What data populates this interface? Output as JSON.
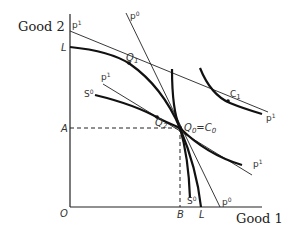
{
  "axes": {
    "y_title": "Good 2",
    "x_title": "Good 1",
    "origin": "O"
  },
  "labels": {
    "L_y": "L",
    "L_x": "L",
    "A": "A",
    "B": "B",
    "Q1": "Q",
    "Q1_sub": "1",
    "Q2": "Q",
    "Q2_sub": "2",
    "Q0": "Q",
    "Q0_sub": "0",
    "Q0_eq": "=C",
    "C0_sub": "0",
    "C1": "C",
    "C1_sub": "1",
    "p1_top": "p",
    "p1_top_sup": "1",
    "p0_top": "p",
    "p0_top_sup": "0",
    "p1_mid": "p",
    "p1_mid_sup": "1",
    "S0_left": "S",
    "S0_left_sup": "0",
    "p1_right_upper": "p",
    "p1_right_upper_sup": "1",
    "p1_right_lower": "p",
    "p1_right_lower_sup": "1",
    "S0_bottom": "S",
    "S0_bottom_sup": "0",
    "p0_bottom": "p",
    "p0_bottom_sup": "0"
  },
  "colors": {
    "line": "#222222",
    "background": "#ffffff"
  }
}
